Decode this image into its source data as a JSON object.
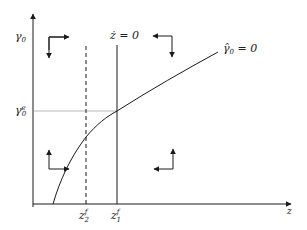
{
  "diagram": {
    "type": "phase-diagram",
    "colors": {
      "line": "#1a1a1a",
      "guide": "#999999",
      "background": "#ffffff"
    },
    "axes": {
      "y_label": {
        "base": "γ",
        "sub": "0"
      },
      "x_label": "z"
    },
    "y_ticks": {
      "equilibrium": {
        "base": "γ",
        "sub": "0",
        "sup": "e"
      }
    },
    "x_ticks": [
      {
        "base": "z",
        "sub": "2",
        "sup": "f",
        "style": "dashed"
      },
      {
        "base": "z",
        "sub": "1",
        "sup": "f",
        "style": "solid"
      }
    ],
    "loci": {
      "z_dot": {
        "label": "ż = 0"
      },
      "gamma_hat": {
        "label_base": "γ̂",
        "label_sub": "0",
        "label_rest": " = 0"
      }
    },
    "direction_arrows": [
      {
        "region": "top-left",
        "horizontal": "right",
        "vertical": "down"
      },
      {
        "region": "top-right",
        "horizontal": "left",
        "vertical": "down"
      },
      {
        "region": "bottom-left",
        "horizontal": "right",
        "vertical": "up"
      },
      {
        "region": "bottom-right",
        "horizontal": "left",
        "vertical": "up"
      }
    ]
  }
}
